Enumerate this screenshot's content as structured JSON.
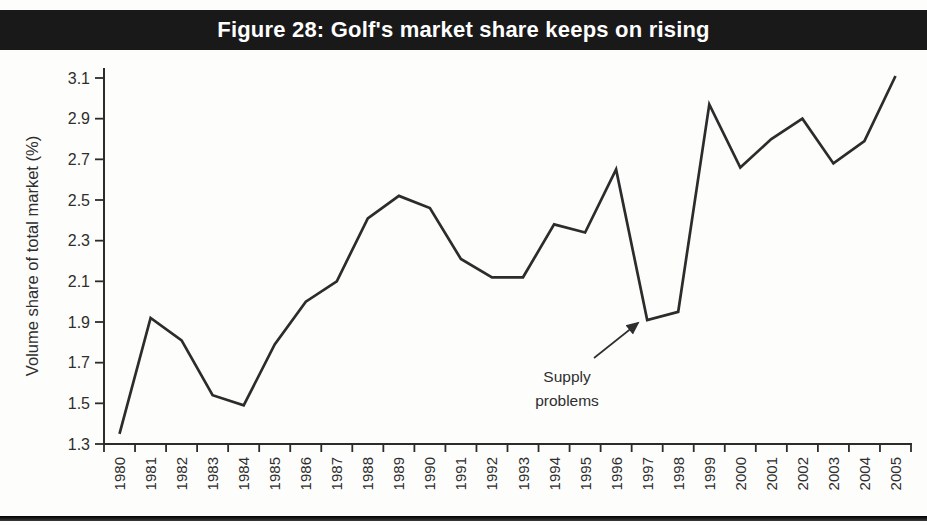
{
  "header": {
    "background_color": "#191919",
    "text_color": "#ffffff"
  },
  "chart_data": {
    "type": "line",
    "title": "Figure 28: Golf's market share keeps on rising",
    "xlabel": "",
    "ylabel": "Volume share of total market (%)",
    "categories": [
      "1980",
      "1981",
      "1982",
      "1983",
      "1984",
      "1985",
      "1986",
      "1987",
      "1988",
      "1989",
      "1990",
      "1991",
      "1992",
      "1993",
      "1994",
      "1995",
      "1996",
      "1997",
      "1998",
      "1999",
      "2000",
      "2001",
      "2002",
      "2003",
      "2004",
      "2005"
    ],
    "values": [
      1.35,
      1.92,
      1.81,
      1.54,
      1.49,
      1.79,
      2.0,
      2.1,
      2.41,
      2.52,
      2.46,
      2.21,
      2.12,
      2.12,
      2.38,
      2.34,
      2.65,
      1.91,
      1.95,
      2.97,
      2.66,
      2.8,
      2.9,
      2.68,
      2.79,
      3.11
    ],
    "ylim": [
      1.3,
      3.1
    ],
    "yticks": [
      1.3,
      1.5,
      1.7,
      1.9,
      2.1,
      2.3,
      2.5,
      2.7,
      2.9,
      3.1
    ],
    "grid": false,
    "legend_position": "none",
    "line_color": "#2c2c2c",
    "annotation": {
      "lines": [
        "Supply",
        "problems"
      ],
      "target_year": "1997"
    }
  }
}
